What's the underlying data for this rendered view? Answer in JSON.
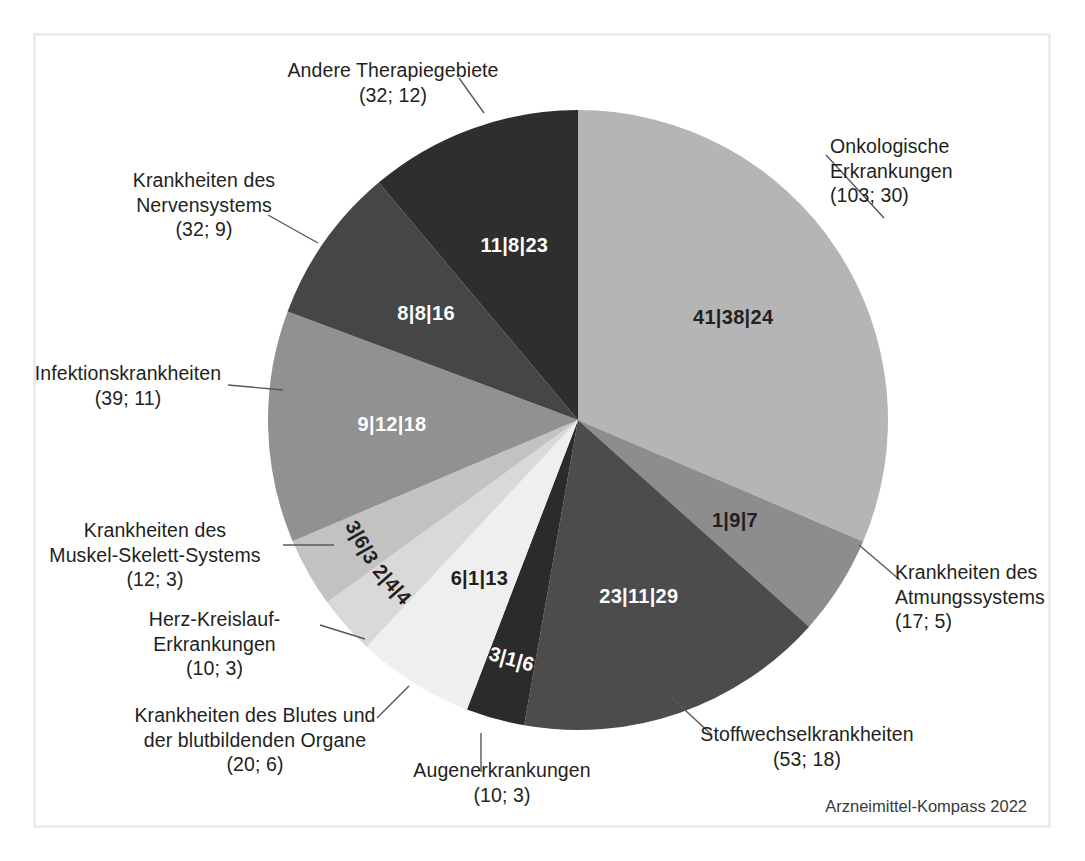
{
  "figure": {
    "source_note": "Arzneimittel-Kompass 2022",
    "background": "#ffffff",
    "frame_color": "#ececed"
  },
  "chart_data": {
    "type": "pie",
    "title": "",
    "subtitle": "",
    "xlabel": "",
    "ylabel": "",
    "legend_position": "callouts",
    "grid": false,
    "label_format": "name (n; percent) with in-slice triple values a|b|c",
    "total_n": 328,
    "categories": [
      "Onkologische Erkrankungen",
      "Krankheiten des Atmungssystems",
      "Stoffwechselkrankheiten",
      "Augenerkrankungen",
      "Krankheiten des Blutes und der blutbildenden Organe",
      "Herz-Kreislauf-Erkrankungen",
      "Krankheiten des Muskel-Skelett-Systems",
      "Infektionskrankheiten",
      "Krankheiten des Nervensystems",
      "Andere Therapiegebiete"
    ],
    "values": [
      30,
      5,
      18,
      3,
      6,
      3,
      3,
      11,
      9,
      12
    ],
    "counts": [
      103,
      17,
      53,
      10,
      20,
      10,
      12,
      39,
      32,
      32
    ],
    "slice_labels": [
      "41|38|24",
      "1|9|7",
      "23|11|29",
      "3|1|6",
      "6|1|13",
      "2|4|4",
      "3|6|3",
      "9|12|18",
      "8|8|16",
      "11|8|23"
    ],
    "colors": [
      "#b5b5b5",
      "#8d8d8d",
      "#4c4c4c",
      "#2b2b2b",
      "#efefef",
      "#d9d9d9",
      "#c2c2c2",
      "#919191",
      "#464646",
      "#2e2e2e"
    ],
    "slices": [
      {
        "name": "Onkologische Erkrankungen",
        "count": 103,
        "percent": 30,
        "caption": "Onkologische\nErkrankungen\n(103; 30)",
        "slice_label": "41|38|24",
        "color": "#b5b5b5",
        "label_color": "#231f20",
        "start_angle": 0,
        "end_angle": 113.1
      },
      {
        "name": "Krankheiten des Atmungssystems",
        "count": 17,
        "percent": 5,
        "caption": "Krankheiten des\nAtmungssystems\n(17; 5)",
        "slice_label": "1|9|7",
        "color": "#8d8d8d",
        "label_color": "#231f20",
        "start_angle": 113.1,
        "end_angle": 131.8
      },
      {
        "name": "Stoffwechselkrankheiten",
        "count": 53,
        "percent": 18,
        "caption": "Stoffwechselkrankheiten\n(53; 18)",
        "slice_label": "23|11|29",
        "color": "#4c4c4c",
        "label_color": "#ffffff",
        "start_angle": 131.8,
        "end_angle": 190.0
      },
      {
        "name": "Augenerkrankungen",
        "count": 10,
        "percent": 3,
        "caption": "Augenerkrankungen\n(10; 3)",
        "slice_label": "3|1|6",
        "color": "#2b2b2b",
        "label_color": "#ffffff",
        "start_angle": 190.0,
        "end_angle": 201.0
      },
      {
        "name": "Krankheiten des Blutes und der blutbildenden Organe",
        "count": 20,
        "percent": 6,
        "caption": "Krankheiten des Blutes und\nder blutbildenden Organe\n(20; 6)",
        "slice_label": "6|1|13",
        "color": "#efefef",
        "label_color": "#231f20",
        "start_angle": 201.0,
        "end_angle": 223.0
      },
      {
        "name": "Herz-Kreislauf-Erkrankungen",
        "count": 10,
        "percent": 3,
        "caption": "Herz-Kreislauf-\nErkrankungen\n(10; 3)",
        "slice_label": "2|4|4",
        "color": "#d9d9d9",
        "label_color": "#231f20",
        "start_angle": 223.0,
        "end_angle": 234.0
      },
      {
        "name": "Krankheiten des Muskel-Skelett-Systems",
        "count": 12,
        "percent": 3,
        "caption": "Krankheiten des\nMuskel-Skelett-Systems\n(12; 3)",
        "slice_label": "3|6|3",
        "color": "#c2c2c2",
        "label_color": "#231f20",
        "start_angle": 234.0,
        "end_angle": 247.0
      },
      {
        "name": "Infektionskrankheiten",
        "count": 39,
        "percent": 11,
        "caption": "Infektionskrankheiten\n(39; 11)",
        "slice_label": "9|12|18",
        "color": "#919191",
        "label_color": "#ffffff",
        "start_angle": 247.0,
        "end_angle": 290.5
      },
      {
        "name": "Krankheiten des Nervensystems",
        "count": 32,
        "percent": 9,
        "caption": "Krankheiten des\nNervensystems\n(32; 9)",
        "slice_label": "8|8|16",
        "color": "#464646",
        "label_color": "#ffffff",
        "start_angle": 290.5,
        "end_angle": 320.0
      },
      {
        "name": "Andere Therapiegebiete",
        "count": 32,
        "percent": 12,
        "caption": "Andere Therapiegebiete\n(32; 12)",
        "slice_label": "11|8|23",
        "color": "#2e2e2e",
        "label_color": "#ffffff",
        "start_angle": 320.0,
        "end_angle": 360.0
      }
    ]
  },
  "callouts": {
    "onkologische": "Onkologische\nErkrankungen\n(103; 30)",
    "atmungssystem": "Krankheiten des\nAtmungssystems\n(17; 5)",
    "stoffwechsel": "Stoffwechselkrankheiten\n(53; 18)",
    "augen": "Augenerkrankungen\n(10; 3)",
    "blut": "Krankheiten des Blutes und\nder blutbildenden Organe\n(20; 6)",
    "herz": "Herz-Kreislauf-\nErkrankungen\n(10; 3)",
    "muskel": "Krankheiten des\nMuskel-Skelett-Systems\n(12; 3)",
    "infektion": "Infektionskrankheiten\n(39; 11)",
    "nerven": "Krankheiten des\nNervensystems\n(32; 9)",
    "andere": "Andere Therapiegebiete\n(32; 12)"
  }
}
